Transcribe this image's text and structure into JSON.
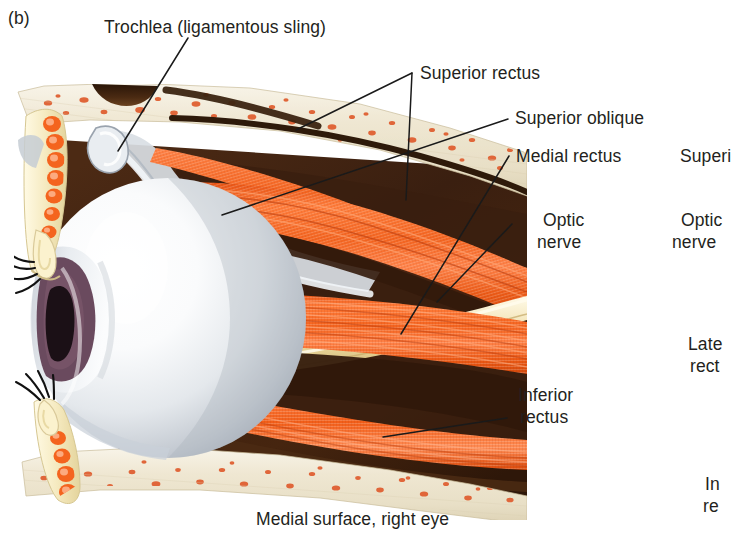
{
  "figure": {
    "panel_letter": "(b)",
    "caption": "Medial surface, right eye",
    "view_title": "Medial surface, right eye"
  },
  "labels": {
    "trochlea": "Trochlea (ligamentous sling)",
    "superior_rectus": "Superior rectus",
    "superior_oblique": "Superior oblique",
    "medial_rectus": "Medial rectus",
    "optic_nerve_line1": "Optic",
    "optic_nerve_line2": "nerve",
    "inferior_rectus_line1": "Inferior",
    "inferior_rectus_line2": "rectus"
  },
  "adjacent_panel_labels": {
    "superior_clipped": "Superi",
    "optic_line1": "Optic",
    "optic_line2": "nerve",
    "lateral_line1": "Late",
    "lateral_line2": "rect",
    "inferior_line1": "In",
    "inferior_line2": "re"
  },
  "colors": {
    "muscle_orange": "#F4641F",
    "muscle_orange_light": "#FF8347",
    "muscle_orange_dark": "#D8470C",
    "bone_cream": "#EFE7D4",
    "bone_cream_light": "#F7F2E6",
    "marrow_speckle": "#E0663A",
    "orbital_fat_dark": "#3C2011",
    "orbital_fat_mid": "#553018",
    "sclera_white": "#FDFDFD",
    "sclera_shadow": "#B9BEC6",
    "iris_purple": "#6A4A5E",
    "pupil_dark": "#1B1016",
    "optic_nerve_cream": "#F2E3B8",
    "tarsal_yellow": "#F5EBC2",
    "leader_line": "#1A1A1A",
    "text": "#231f20",
    "background": "#FFFFFF"
  },
  "anatomy_parts": [
    "orbital roof bone",
    "frontal sinus cavity",
    "superior rectus muscle",
    "superior oblique muscle",
    "trochlea",
    "medial rectus muscle",
    "optic nerve",
    "inferior rectus muscle",
    "orbital floor bone",
    "eyeball sclera",
    "cornea",
    "iris",
    "pupil",
    "upper eyelid",
    "lower eyelid",
    "eyelashes",
    "orbital fat"
  ]
}
